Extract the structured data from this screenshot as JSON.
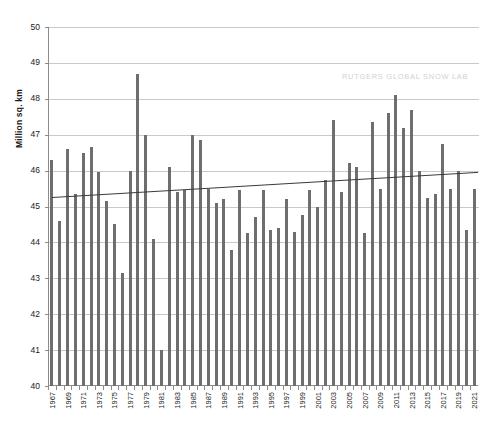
{
  "chart_data": {
    "type": "bar",
    "title": "",
    "subtitle": "",
    "xlabel": "",
    "ylabel": "Million sq. km",
    "ylim": [
      40,
      50
    ],
    "ytick_labels": [
      "40",
      "41",
      "42",
      "43",
      "44",
      "45",
      "46",
      "47",
      "48",
      "49",
      "50"
    ],
    "yticks": [
      40,
      41,
      42,
      43,
      44,
      45,
      46,
      47,
      48,
      49,
      50
    ],
    "grid": true,
    "legend": false,
    "legend_position": "none",
    "annotations": [
      "RUTGERS GLOBAL SNOW LAB"
    ],
    "bar_color": "#6e6e6e",
    "trendline_color": "#3a3a3a",
    "gridline_color": "#c9c9c9",
    "axis_color": "#8c8c8c",
    "xtick_label_interval": 2,
    "categories": [
      "1967",
      "1968",
      "1969",
      "1970",
      "1971",
      "1972",
      "1973",
      "1974",
      "1975",
      "1976",
      "1977",
      "1978",
      "1979",
      "1980",
      "1981",
      "1982",
      "1983",
      "1984",
      "1985",
      "1986",
      "1987",
      "1988",
      "1989",
      "1990",
      "1991",
      "1992",
      "1993",
      "1994",
      "1995",
      "1996",
      "1997",
      "1998",
      "1999",
      "2000",
      "2001",
      "2002",
      "2003",
      "2004",
      "2005",
      "2006",
      "2007",
      "2008",
      "2009",
      "2010",
      "2011",
      "2012",
      "2013",
      "2014",
      "2015",
      "2016",
      "2017",
      "2018",
      "2019",
      "2020",
      "2021"
    ],
    "values": [
      46.3,
      44.6,
      46.6,
      45.35,
      46.5,
      46.65,
      45.95,
      45.15,
      44.5,
      43.15,
      46.0,
      48.7,
      47.0,
      44.1,
      41.0,
      46.1,
      45.4,
      45.45,
      47.0,
      46.85,
      45.5,
      45.1,
      45.2,
      43.8,
      45.45,
      44.25,
      44.7,
      45.45,
      44.35,
      44.4,
      45.2,
      44.3,
      44.75,
      45.45,
      45.0,
      45.75,
      47.4,
      45.4,
      46.2,
      46.1,
      44.25,
      47.35,
      45.5,
      47.6,
      48.1,
      47.2,
      47.7,
      46.0,
      45.25,
      45.35,
      46.75,
      45.5,
      46.0,
      44.35,
      45.5
    ],
    "trendline": {
      "start_year": "1967",
      "end_year": "2021",
      "start_value": 45.25,
      "end_value": 45.95
    }
  }
}
